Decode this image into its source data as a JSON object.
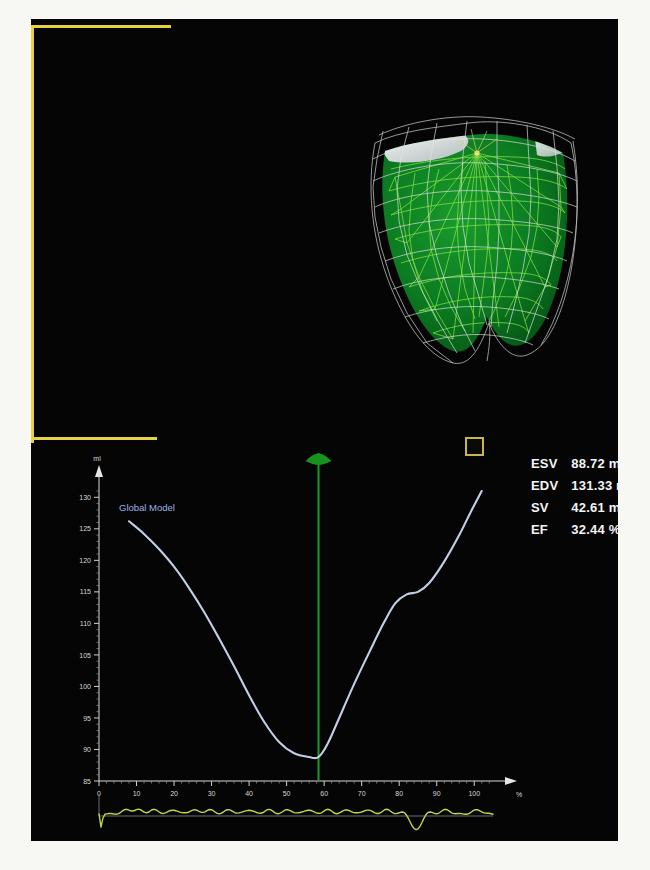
{
  "panel": {
    "background_color": "#050505",
    "bracket_color": "#e8d23c",
    "marker_name": "region-of-interest-marker"
  },
  "model": {
    "name": "3d-ventricle-mesh",
    "surface_color": "#0a7a22",
    "mesh_color": "#7ee03a",
    "shell_color": "#e8e8e8",
    "description": "3D left ventricle endocardial mesh with epicardial wireframe"
  },
  "metrics": {
    "title": "Volume metrics",
    "rows": [
      {
        "key": "ESV",
        "value": "88.72 ml"
      },
      {
        "key": "EDV",
        "value": "131.33 ml"
      },
      {
        "key": "SV",
        "value": "42.61 ml"
      },
      {
        "key": "EF",
        "value": "32.44 %"
      }
    ]
  },
  "chart_data": {
    "type": "line",
    "title": "",
    "series_label": "Global Model",
    "xlabel": "%",
    "ylabel": "ml",
    "xlim": [
      0,
      105
    ],
    "ylim": [
      85,
      131
    ],
    "xticks": [
      0,
      10,
      20,
      30,
      40,
      50,
      60,
      70,
      80,
      90,
      100
    ],
    "yticks": [
      85,
      90,
      95,
      100,
      105,
      110,
      115,
      120,
      125,
      130
    ],
    "grid": false,
    "legend_position": "top-left",
    "line_color": "#c3cfe8",
    "cursor": {
      "x": 58.5,
      "color": "#17a01e",
      "label": "end-systole cursor"
    },
    "x": [
      8,
      12,
      16,
      20,
      24,
      28,
      32,
      36,
      40,
      44,
      48,
      52,
      56,
      58.5,
      61,
      64,
      68,
      72,
      76,
      79,
      82,
      85,
      88,
      92,
      96,
      99,
      102
    ],
    "values": [
      126.2,
      124.2,
      121.8,
      119.0,
      115.6,
      111.8,
      107.6,
      103.2,
      98.6,
      94.4,
      91.2,
      89.4,
      88.8,
      88.8,
      91.0,
      95.0,
      100.4,
      105.4,
      110.2,
      113.2,
      114.6,
      115.0,
      116.4,
      119.8,
      124.0,
      127.6,
      131.0
    ]
  },
  "waveform": {
    "name": "ecg-trace",
    "color": "#b9d94a",
    "baseline_color": "#6b6b78",
    "description": "Gated ECG trigger trace with initial and late negative deflections"
  }
}
